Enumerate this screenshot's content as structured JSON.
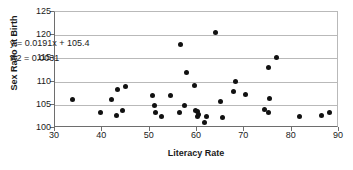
{
  "chart_data": {
    "type": "scatter",
    "title": "",
    "xlabel": "Literacy Rate",
    "ylabel": "Sex Ratio at Birth",
    "xlim": [
      30,
      90
    ],
    "ylim": [
      100,
      125
    ],
    "xticks": [
      30,
      40,
      50,
      60,
      70,
      80,
      90
    ],
    "yticks": [
      100,
      105,
      110,
      115,
      120,
      125
    ],
    "grid": "horizontal",
    "legend": "none",
    "annotations": [
      "y = 0.0191x + 105.4",
      "R2 = 0.0031"
    ],
    "trendline": {
      "slope": 0.0191,
      "intercept": 105.4,
      "r_squared": 0.0031,
      "drawn": false
    },
    "points": [
      {
        "x": 33.8,
        "y": 106.1
      },
      {
        "x": 39.6,
        "y": 103.3
      },
      {
        "x": 42.0,
        "y": 106.2
      },
      {
        "x": 43.0,
        "y": 102.6
      },
      {
        "x": 43.2,
        "y": 108.3
      },
      {
        "x": 44.3,
        "y": 103.8
      },
      {
        "x": 44.8,
        "y": 108.9
      },
      {
        "x": 50.5,
        "y": 106.9
      },
      {
        "x": 51.1,
        "y": 104.9
      },
      {
        "x": 51.3,
        "y": 103.4
      },
      {
        "x": 52.6,
        "y": 102.4
      },
      {
        "x": 54.4,
        "y": 107.0
      },
      {
        "x": 56.2,
        "y": 103.4
      },
      {
        "x": 56.5,
        "y": 117.9
      },
      {
        "x": 57.4,
        "y": 104.8
      },
      {
        "x": 57.8,
        "y": 111.9
      },
      {
        "x": 59.5,
        "y": 109.2
      },
      {
        "x": 59.6,
        "y": 103.7
      },
      {
        "x": 60.0,
        "y": 103.5
      },
      {
        "x": 60.2,
        "y": 102.4
      },
      {
        "x": 60.4,
        "y": 102.9
      },
      {
        "x": 61.6,
        "y": 101.2
      },
      {
        "x": 62.0,
        "y": 102.4
      },
      {
        "x": 63.9,
        "y": 120.5
      },
      {
        "x": 64.9,
        "y": 105.7
      },
      {
        "x": 65.4,
        "y": 102.3
      },
      {
        "x": 67.8,
        "y": 107.9
      },
      {
        "x": 68.2,
        "y": 110.0
      },
      {
        "x": 70.3,
        "y": 107.2
      },
      {
        "x": 74.2,
        "y": 103.9
      },
      {
        "x": 75.0,
        "y": 113.1
      },
      {
        "x": 75.1,
        "y": 103.3
      },
      {
        "x": 75.4,
        "y": 106.4
      },
      {
        "x": 76.8,
        "y": 115.1
      },
      {
        "x": 81.7,
        "y": 102.4
      },
      {
        "x": 86.3,
        "y": 102.7
      },
      {
        "x": 87.9,
        "y": 103.4
      }
    ]
  },
  "colors": {
    "marker": "#111111",
    "gridline": "#b9b9b9",
    "axis": "#6e6e6e",
    "background": "#ffffff",
    "text": "#1a1a1a"
  }
}
